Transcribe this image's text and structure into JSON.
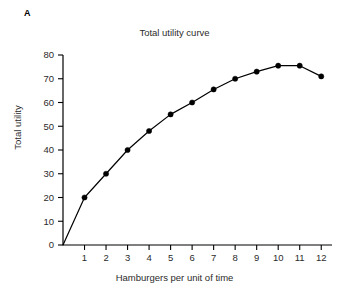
{
  "panel": {
    "label": "A"
  },
  "chart_data": {
    "type": "line",
    "title": "Total utility curve",
    "xlabel": "Hamburgers per unit of time",
    "ylabel": "Total utility",
    "x": [
      0,
      1,
      2,
      3,
      4,
      5,
      6,
      7,
      8,
      9,
      10,
      11,
      12
    ],
    "values": [
      0,
      20,
      30,
      40,
      48,
      55,
      60,
      65.5,
      70,
      73,
      75.5,
      75.5,
      71
    ],
    "marker_x": [
      1,
      2,
      3,
      4,
      5,
      6,
      7,
      8,
      9,
      10,
      11,
      12
    ],
    "marker_values": [
      20,
      30,
      40,
      48,
      55,
      60,
      65.5,
      70,
      73,
      75.5,
      75.5,
      71
    ],
    "xlim": [
      0,
      12.5
    ],
    "ylim": [
      0,
      80
    ],
    "xticks": [
      1,
      2,
      3,
      4,
      5,
      6,
      7,
      8,
      9,
      10,
      11,
      12
    ],
    "xtick_labels": [
      "1",
      "2",
      "3",
      "4",
      "5",
      "6",
      "7",
      "8",
      "9",
      "10",
      "11",
      "12"
    ],
    "yticks": [
      0,
      10,
      20,
      30,
      40,
      50,
      60,
      70,
      80
    ],
    "ytick_labels": [
      "0",
      "10",
      "20",
      "30",
      "40",
      "50",
      "60",
      "70",
      "80"
    ],
    "grid": false,
    "legend": "none",
    "line_color": "#000000",
    "marker_color": "#000000",
    "marker_shape": "circle",
    "axis_color": "#000000"
  }
}
